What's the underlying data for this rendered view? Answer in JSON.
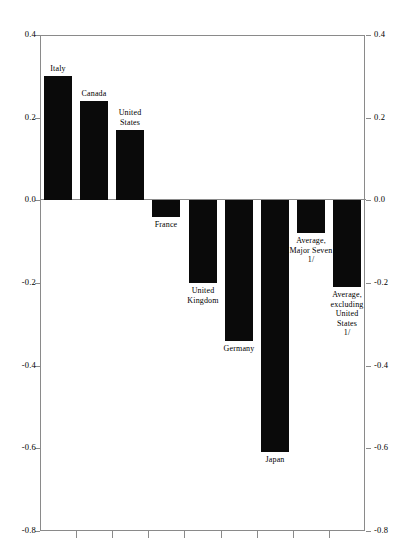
{
  "chart_data": {
    "type": "bar",
    "title": "",
    "subtitle": "",
    "xlabel": "",
    "ylabel": "",
    "ylim": [
      -0.8,
      0.4
    ],
    "yticks": [
      0.4,
      0.2,
      0.0,
      -0.2,
      -0.4,
      -0.6,
      -0.8
    ],
    "ytick_labels": [
      "0.4",
      "0.2",
      "0.0",
      "-0.2",
      "-0.4",
      "-0.6",
      "-0.8"
    ],
    "ytick_labels_right": [
      "0.4",
      "0.2",
      "0.0",
      "-0.2",
      "-0.4",
      "-0.6",
      "-0.8"
    ],
    "grid": false,
    "legend": "none",
    "zero_line": true,
    "categories": [
      "Italy",
      "Canada",
      "United States",
      "France",
      "United Kingdom",
      "Germany",
      "Japan",
      "Average, Major Seven 1/",
      "Average, excluding United States 1/"
    ],
    "values": [
      0.3,
      0.24,
      0.17,
      -0.04,
      -0.2,
      -0.34,
      -0.61,
      -0.08,
      -0.21
    ],
    "bars": [
      {
        "label": "Italy",
        "label_text": "Italy",
        "value": 0.3,
        "label_pos": "above"
      },
      {
        "label": "Canada",
        "label_text": "Canada",
        "value": 0.24,
        "label_pos": "above"
      },
      {
        "label": "United States",
        "label_text": "United\nStates",
        "value": 0.17,
        "label_pos": "above"
      },
      {
        "label": "France",
        "label_text": "France",
        "value": -0.04,
        "label_pos": "below"
      },
      {
        "label": "United Kingdom",
        "label_text": "United\nKingdom",
        "value": -0.2,
        "label_pos": "below"
      },
      {
        "label": "Germany",
        "label_text": "Germany",
        "value": -0.34,
        "label_pos": "below"
      },
      {
        "label": "Japan",
        "label_text": "Japan",
        "value": -0.61,
        "label_pos": "below"
      },
      {
        "label": "Average, Major Seven",
        "label_text": "Average,\nMajor  Seven\n1/",
        "value": -0.08,
        "label_pos": "below"
      },
      {
        "label": "Average, excluding United States",
        "label_text": "Average,\nexcluding\nUnited\nStates\n1/",
        "value": -0.21,
        "label_pos": "below"
      }
    ],
    "bar_color": "#0a0a0a",
    "axis_color": "#8a8a8a"
  }
}
